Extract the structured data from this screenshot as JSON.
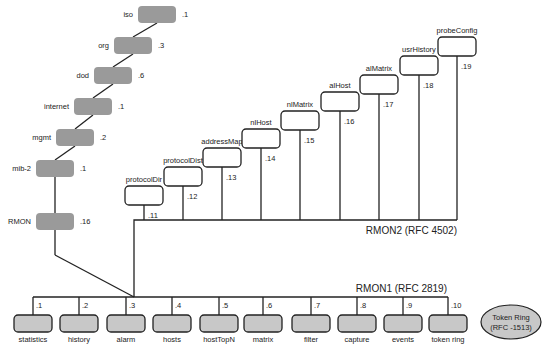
{
  "colors": {
    "grey_box": "#9a9a9a",
    "light_box": "#c8c8c8",
    "white_box": "#ffffff",
    "line": "#222222",
    "text": "#222222"
  },
  "oid_chain": [
    {
      "label": "iso",
      "oid": ".1",
      "x": 138,
      "y": 6
    },
    {
      "label": "org",
      "oid": ".3",
      "x": 114,
      "y": 37
    },
    {
      "label": "dod",
      "oid": ".6",
      "x": 94,
      "y": 67
    },
    {
      "label": "internet",
      "oid": ".1",
      "x": 74,
      "y": 98
    },
    {
      "label": "mgmt",
      "oid": ".2",
      "x": 56,
      "y": 129
    },
    {
      "label": "mib-2",
      "oid": ".1",
      "x": 36,
      "y": 160
    },
    {
      "label": "RMON",
      "oid": ".16",
      "x": 36,
      "y": 213
    }
  ],
  "rmon2": {
    "title": "RMON2 (RFC 4502)",
    "groups": [
      {
        "label": "protocolDir",
        "oid": ".11",
        "x": 125,
        "y": 186
      },
      {
        "label": "protocolDist",
        "oid": ".12",
        "x": 164,
        "y": 167
      },
      {
        "label": "addressMap",
        "oid": ".13",
        "x": 203,
        "y": 148
      },
      {
        "label": "nlHost",
        "oid": ".14",
        "x": 242,
        "y": 129
      },
      {
        "label": "nlMatrix",
        "oid": ".15",
        "x": 281,
        "y": 111
      },
      {
        "label": "alHost",
        "oid": ".16",
        "x": 321,
        "y": 92
      },
      {
        "label": "alMatrix",
        "oid": ".17",
        "x": 360,
        "y": 75
      },
      {
        "label": "usrHistory",
        "oid": ".18",
        "x": 400,
        "y": 56
      },
      {
        "label": "probeConfig",
        "oid": ".19",
        "x": 438,
        "y": 37
      }
    ]
  },
  "rmon1": {
    "title": "RMON1 (RFC 2819)",
    "groups": [
      {
        "label": "statistics",
        "oid": ".1",
        "x": 14
      },
      {
        "label": "history",
        "oid": ".2",
        "x": 60
      },
      {
        "label": "alarm",
        "oid": ".3",
        "x": 107
      },
      {
        "label": "hosts",
        "oid": ".4",
        "x": 153
      },
      {
        "label": "hostTopN",
        "oid": ".5",
        "x": 200
      },
      {
        "label": "matrix",
        "oid": ".6",
        "x": 244
      },
      {
        "label": "filter",
        "oid": ".7",
        "x": 292
      },
      {
        "label": "capture",
        "oid": ".8",
        "x": 338
      },
      {
        "label": "events",
        "oid": ".9",
        "x": 384
      },
      {
        "label": "token ring",
        "oid": ".10",
        "x": 429
      }
    ]
  },
  "token_ring": {
    "line1": "Token Ring",
    "line2": "(RFC -1513)"
  }
}
